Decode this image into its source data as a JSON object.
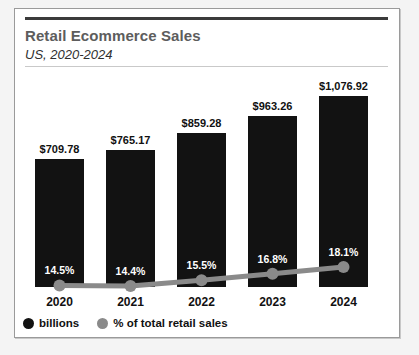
{
  "card": {
    "title": "Retail Ecommerce Sales",
    "subtitle": "US, 2020-2024"
  },
  "legend": {
    "items": [
      {
        "label": "billions",
        "marker": "circle-black-icon",
        "color": "#121212"
      },
      {
        "label": "% of total retail sales",
        "marker": "circle-gray-icon",
        "color": "#8a8a8a"
      }
    ]
  },
  "chart_data": {
    "type": "bar",
    "title": "Retail Ecommerce Sales",
    "subtitle": "US, 2020-2024",
    "xlabel": "",
    "ylabel": "",
    "grid": false,
    "legend_position": "bottom-left",
    "categories": [
      "2020",
      "2021",
      "2022",
      "2023",
      "2024"
    ],
    "series": [
      {
        "name": "billions",
        "type": "bar",
        "color": "#121212",
        "values": [
          709.78,
          765.17,
          859.28,
          963.26,
          1076.92
        ],
        "labels": [
          "$709.78",
          "$765.17",
          "$859.28",
          "$963.26",
          "$1,076.92"
        ]
      },
      {
        "name": "% of total retail sales",
        "type": "line",
        "color": "#8a8a8a",
        "values": [
          14.5,
          14.4,
          15.5,
          16.8,
          18.1
        ],
        "labels": [
          "14.5%",
          "14.4%",
          "15.5%",
          "16.8%",
          "18.1%"
        ]
      }
    ]
  }
}
